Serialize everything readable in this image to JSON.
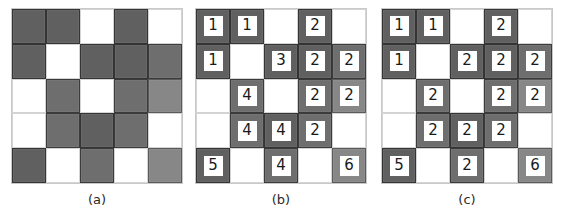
{
  "figure": {
    "grid_rows": 5,
    "grid_cols": 5,
    "colors": {
      "foreground": "#6e6e6e",
      "foreground_light": "#878787",
      "foreground_dark": "#606060",
      "background": "#ffffff",
      "cell_border": "#3b3b3b",
      "grid_border": "#c9c9c9",
      "label_text": "#1a1a1a",
      "label_background": "#ffffff"
    }
  },
  "panels": [
    {
      "id": "a",
      "caption": "(a)",
      "name": "binary-image-grid",
      "cells": [
        [
          {
            "filled": true,
            "shade": "dark",
            "label": ""
          },
          {
            "filled": true,
            "shade": "dark",
            "label": ""
          },
          {
            "filled": false,
            "shade": "",
            "label": ""
          },
          {
            "filled": true,
            "shade": "dark",
            "label": ""
          },
          {
            "filled": false,
            "shade": "",
            "label": ""
          }
        ],
        [
          {
            "filled": true,
            "shade": "dark",
            "label": ""
          },
          {
            "filled": false,
            "shade": "",
            "label": ""
          },
          {
            "filled": true,
            "shade": "dark",
            "label": ""
          },
          {
            "filled": true,
            "shade": "dark",
            "label": ""
          },
          {
            "filled": true,
            "shade": "",
            "label": ""
          }
        ],
        [
          {
            "filled": false,
            "shade": "",
            "label": ""
          },
          {
            "filled": true,
            "shade": "",
            "label": ""
          },
          {
            "filled": false,
            "shade": "",
            "label": ""
          },
          {
            "filled": true,
            "shade": "",
            "label": ""
          },
          {
            "filled": true,
            "shade": "light",
            "label": ""
          }
        ],
        [
          {
            "filled": false,
            "shade": "",
            "label": ""
          },
          {
            "filled": true,
            "shade": "",
            "label": ""
          },
          {
            "filled": true,
            "shade": "dark",
            "label": ""
          },
          {
            "filled": true,
            "shade": "",
            "label": ""
          },
          {
            "filled": false,
            "shade": "",
            "label": ""
          }
        ],
        [
          {
            "filled": true,
            "shade": "dark",
            "label": ""
          },
          {
            "filled": false,
            "shade": "",
            "label": ""
          },
          {
            "filled": true,
            "shade": "",
            "label": ""
          },
          {
            "filled": false,
            "shade": "",
            "label": ""
          },
          {
            "filled": true,
            "shade": "light",
            "label": ""
          }
        ]
      ]
    },
    {
      "id": "b",
      "caption": "(b)",
      "name": "provisional-labels-grid",
      "cells": [
        [
          {
            "filled": true,
            "shade": "dark",
            "label": "1"
          },
          {
            "filled": true,
            "shade": "dark",
            "label": "1"
          },
          {
            "filled": false,
            "shade": "",
            "label": ""
          },
          {
            "filled": true,
            "shade": "dark",
            "label": "2"
          },
          {
            "filled": false,
            "shade": "",
            "label": ""
          }
        ],
        [
          {
            "filled": true,
            "shade": "dark",
            "label": "1"
          },
          {
            "filled": false,
            "shade": "",
            "label": ""
          },
          {
            "filled": true,
            "shade": "dark",
            "label": "3"
          },
          {
            "filled": true,
            "shade": "dark",
            "label": "2"
          },
          {
            "filled": true,
            "shade": "",
            "label": "2"
          }
        ],
        [
          {
            "filled": false,
            "shade": "",
            "label": ""
          },
          {
            "filled": true,
            "shade": "",
            "label": "4"
          },
          {
            "filled": false,
            "shade": "",
            "label": ""
          },
          {
            "filled": true,
            "shade": "",
            "label": "2"
          },
          {
            "filled": true,
            "shade": "light",
            "label": "2"
          }
        ],
        [
          {
            "filled": false,
            "shade": "",
            "label": ""
          },
          {
            "filled": true,
            "shade": "",
            "label": "4"
          },
          {
            "filled": true,
            "shade": "dark",
            "label": "4"
          },
          {
            "filled": true,
            "shade": "",
            "label": "2"
          },
          {
            "filled": false,
            "shade": "",
            "label": ""
          }
        ],
        [
          {
            "filled": true,
            "shade": "dark",
            "label": "5"
          },
          {
            "filled": false,
            "shade": "",
            "label": ""
          },
          {
            "filled": true,
            "shade": "",
            "label": "4"
          },
          {
            "filled": false,
            "shade": "",
            "label": ""
          },
          {
            "filled": true,
            "shade": "light",
            "label": "6"
          }
        ]
      ]
    },
    {
      "id": "c",
      "caption": "(c)",
      "name": "resolved-labels-grid",
      "cells": [
        [
          {
            "filled": true,
            "shade": "dark",
            "label": "1"
          },
          {
            "filled": true,
            "shade": "dark",
            "label": "1"
          },
          {
            "filled": false,
            "shade": "",
            "label": ""
          },
          {
            "filled": true,
            "shade": "dark",
            "label": "2"
          },
          {
            "filled": false,
            "shade": "",
            "label": ""
          }
        ],
        [
          {
            "filled": true,
            "shade": "dark",
            "label": "1"
          },
          {
            "filled": false,
            "shade": "",
            "label": ""
          },
          {
            "filled": true,
            "shade": "dark",
            "label": "2"
          },
          {
            "filled": true,
            "shade": "dark",
            "label": "2"
          },
          {
            "filled": true,
            "shade": "",
            "label": "2"
          }
        ],
        [
          {
            "filled": false,
            "shade": "",
            "label": ""
          },
          {
            "filled": true,
            "shade": "",
            "label": "2"
          },
          {
            "filled": false,
            "shade": "",
            "label": ""
          },
          {
            "filled": true,
            "shade": "",
            "label": "2"
          },
          {
            "filled": true,
            "shade": "light",
            "label": "2"
          }
        ],
        [
          {
            "filled": false,
            "shade": "",
            "label": ""
          },
          {
            "filled": true,
            "shade": "",
            "label": "2"
          },
          {
            "filled": true,
            "shade": "dark",
            "label": "2"
          },
          {
            "filled": true,
            "shade": "",
            "label": "2"
          },
          {
            "filled": false,
            "shade": "",
            "label": ""
          }
        ],
        [
          {
            "filled": true,
            "shade": "dark",
            "label": "5"
          },
          {
            "filled": false,
            "shade": "",
            "label": ""
          },
          {
            "filled": true,
            "shade": "",
            "label": "2"
          },
          {
            "filled": false,
            "shade": "",
            "label": ""
          },
          {
            "filled": true,
            "shade": "light",
            "label": "6"
          }
        ]
      ]
    }
  ]
}
